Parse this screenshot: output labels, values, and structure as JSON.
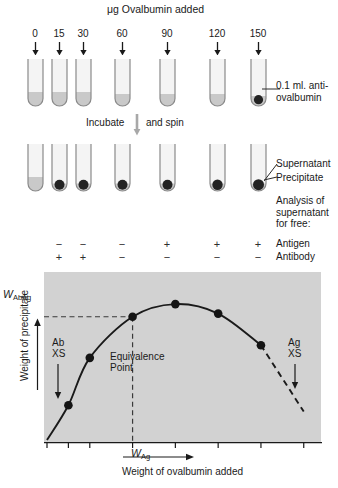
{
  "figure": {
    "title": "μg Ovalbumin added",
    "process_label_left": "Incubate",
    "process_label_right": "and spin",
    "process_arrow_icon": "down-arrow-icon"
  },
  "doses": {
    "unit": "μg",
    "values": [
      "0",
      "15",
      "30",
      "60",
      "90",
      "120",
      "150"
    ],
    "tube_x": [
      35,
      59,
      83,
      122,
      167,
      217,
      258
    ]
  },
  "tube_row_before": {
    "caption": "0.1 ml. anti-ovalbumin",
    "caption_line1": "0.1 ml. anti-",
    "caption_line2": "ovalbumin",
    "fluid_heights": [
      14,
      14,
      14,
      12,
      12,
      12,
      10
    ],
    "precipitate_present": [
      false,
      false,
      false,
      false,
      false,
      false,
      true
    ]
  },
  "tube_row_after": {
    "label_supernatant": "Supernatant",
    "label_precipitate": "Precipitate",
    "precipitate_radius": [
      0,
      5.0,
      5.0,
      5.0,
      5.0,
      5.2,
      5.5
    ],
    "precipitate_present": [
      false,
      true,
      true,
      true,
      true,
      true,
      true
    ],
    "supernatant_heights": [
      14,
      5,
      5,
      5,
      5,
      5,
      4
    ]
  },
  "analysis": {
    "heading_line1": "Analysis of",
    "heading_line2": "supernatant",
    "heading_line3": "for free:",
    "rows": [
      {
        "label": "Antigen",
        "values": [
          "",
          "−",
          "−",
          "−",
          "+",
          "+",
          "+"
        ]
      },
      {
        "label": "Antibody",
        "values": [
          "",
          "+",
          "+",
          "−",
          "−",
          "−",
          "−"
        ]
      }
    ]
  },
  "chart_data": {
    "type": "line",
    "title": "",
    "xlabel": "Weight of ovalbumin added",
    "ylabel": "Weight of precipitate",
    "x": [
      0,
      15,
      30,
      60,
      90,
      120,
      150,
      180
    ],
    "values": [
      0,
      22,
      52,
      78,
      86,
      80,
      60,
      18
    ],
    "xlim": [
      0,
      190
    ],
    "ylim": [
      0,
      100
    ],
    "grid": false,
    "legend": false,
    "marker_points": [
      {
        "x": 15,
        "y": 22
      },
      {
        "x": 30,
        "y": 52
      },
      {
        "x": 60,
        "y": 78
      },
      {
        "x": 90,
        "y": 86
      },
      {
        "x": 120,
        "y": 80
      },
      {
        "x": 150,
        "y": 60
      }
    ],
    "solid_to_x": 150,
    "dashed_from_x": 150,
    "x_ticks": [
      0,
      15,
      30,
      60,
      90,
      120,
      150,
      180
    ],
    "annotations": {
      "equivalence_line1": "Equivalence",
      "equivalence_line2": "Point",
      "ab_excess_line1": "Ab",
      "ab_excess_line2": "XS",
      "ag_excess_line1": "Ag",
      "ag_excess_line2": "XS",
      "w_abag_main": "W",
      "w_abag_sub": "AbAg",
      "w_ag_main": "W",
      "w_ag_sub": "Ag"
    },
    "equivalence_point": {
      "x": 60,
      "y": 78
    },
    "colors": {
      "plot_background": "#d2d2d2",
      "curve": "#1a1a1a",
      "marker": "#141414",
      "guide_line": "#3a3a3a"
    }
  },
  "icons": {
    "dose_arrow": "down-arrow-icon",
    "spin_arrow": "down-arrow-icon",
    "excess_arrow": "down-arrow-icon",
    "x_axis_direction_arrow": "right-arrow-icon",
    "y_axis_direction_arrow": "up-arrow-icon"
  }
}
